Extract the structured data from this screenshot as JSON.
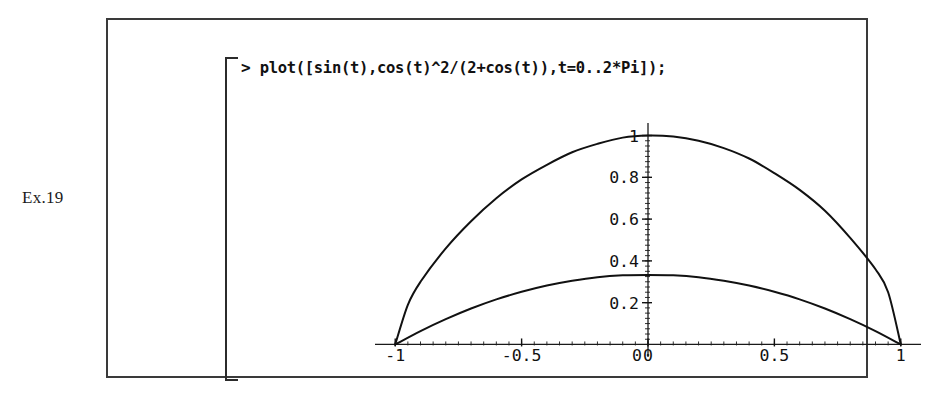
{
  "page": {
    "exercise_label": "Ex.19",
    "background_color": "#ffffff",
    "ink_color": "#111111"
  },
  "worksheet": {
    "prompt_symbol": ">",
    "command": "plot([sin(t),cos(t)^2/(2+cos(t)),t=0..2*Pi]);"
  },
  "chart_data": {
    "type": "line",
    "title": "",
    "subtitle": "",
    "xlabel": "",
    "ylabel": "",
    "grid": false,
    "legend": null,
    "axes_style": "crossed-axes-with-ticks",
    "xlim": [
      -1.08,
      1.08
    ],
    "ylim": [
      -0.06,
      1.06
    ],
    "xticks": [
      -1,
      -0.5,
      0,
      0.5,
      1
    ],
    "xtick_labels": [
      "-1",
      "-0.5",
      "0",
      "0.5",
      "1"
    ],
    "yticks": [
      0,
      0.2,
      0.4,
      0.6,
      0.8,
      1
    ],
    "ytick_labels": [
      "0",
      "0.2",
      "0.4",
      "0.6",
      "0.8",
      "1"
    ],
    "minor_tick_step_x": 0.05,
    "minor_tick_step_y": 0.025,
    "series": [
      {
        "name": "x=sin(t), y=|sin(t)|-envelope (upper curve)",
        "expression": "sin(t)",
        "parameter": "t",
        "parameter_range": [
          0,
          6.283185307
        ],
        "x": [
          -1,
          -0.95,
          -0.9,
          -0.8,
          -0.7,
          -0.6,
          -0.5,
          -0.4,
          -0.3,
          -0.2,
          -0.1,
          0,
          0.1,
          0.2,
          0.3,
          0.4,
          0.5,
          0.6,
          0.7,
          0.8,
          0.9,
          0.95,
          1
        ],
        "y": [
          0,
          0.19,
          0.3,
          0.46,
          0.59,
          0.7,
          0.79,
          0.86,
          0.92,
          0.96,
          0.99,
          1,
          0.995,
          0.975,
          0.94,
          0.89,
          0.82,
          0.74,
          0.64,
          0.51,
          0.36,
          0.25,
          0
        ]
      },
      {
        "name": "y=cos(t)^2/(2+cos(t)) (lower curve)",
        "expression": "cos(t)^2/(2+cos(t))",
        "parameter": "t",
        "parameter_range": [
          0,
          6.283185307
        ],
        "x": [
          -1,
          -0.9,
          -0.8,
          -0.7,
          -0.6,
          -0.5,
          -0.4,
          -0.3,
          -0.2,
          -0.1,
          0,
          0.1,
          0.2,
          0.3,
          0.4,
          0.5,
          0.6,
          0.7,
          0.8,
          0.9,
          1
        ],
        "y": [
          0,
          0.064,
          0.121,
          0.172,
          0.216,
          0.252,
          0.282,
          0.305,
          0.322,
          0.331,
          0.333,
          0.331,
          0.322,
          0.305,
          0.282,
          0.252,
          0.216,
          0.172,
          0.121,
          0.064,
          0
        ]
      }
    ]
  }
}
